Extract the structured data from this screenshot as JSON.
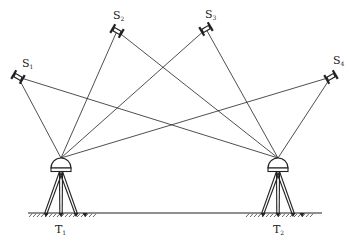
{
  "diagram": {
    "title": "",
    "colors": {
      "stroke": "#222222",
      "background": "#ffffff"
    },
    "satellites": [
      {
        "id": "S1",
        "label": "S",
        "sub": "1",
        "x": 18,
        "y": 77,
        "angle": 30,
        "lx": 22,
        "ly": 67
      },
      {
        "id": "S2",
        "label": "S",
        "sub": "2",
        "x": 117,
        "y": 31,
        "angle": 30,
        "lx": 113,
        "ly": 19
      },
      {
        "id": "S3",
        "label": "S",
        "sub": "3",
        "x": 206,
        "y": 29,
        "angle": -30,
        "lx": 205,
        "ly": 18
      },
      {
        "id": "S4",
        "label": "S",
        "sub": "4",
        "x": 331,
        "y": 77,
        "angle": -30,
        "lx": 333,
        "ly": 64
      }
    ],
    "receivers": [
      {
        "id": "T1",
        "label": "T",
        "sub": "1",
        "x": 61,
        "top": 158,
        "lx": 55,
        "ly": 233
      },
      {
        "id": "T2",
        "label": "T",
        "sub": "2",
        "x": 278,
        "top": 158,
        "lx": 273,
        "ly": 233
      }
    ],
    "ground": {
      "x1": 28,
      "x2": 322,
      "y": 213
    }
  }
}
